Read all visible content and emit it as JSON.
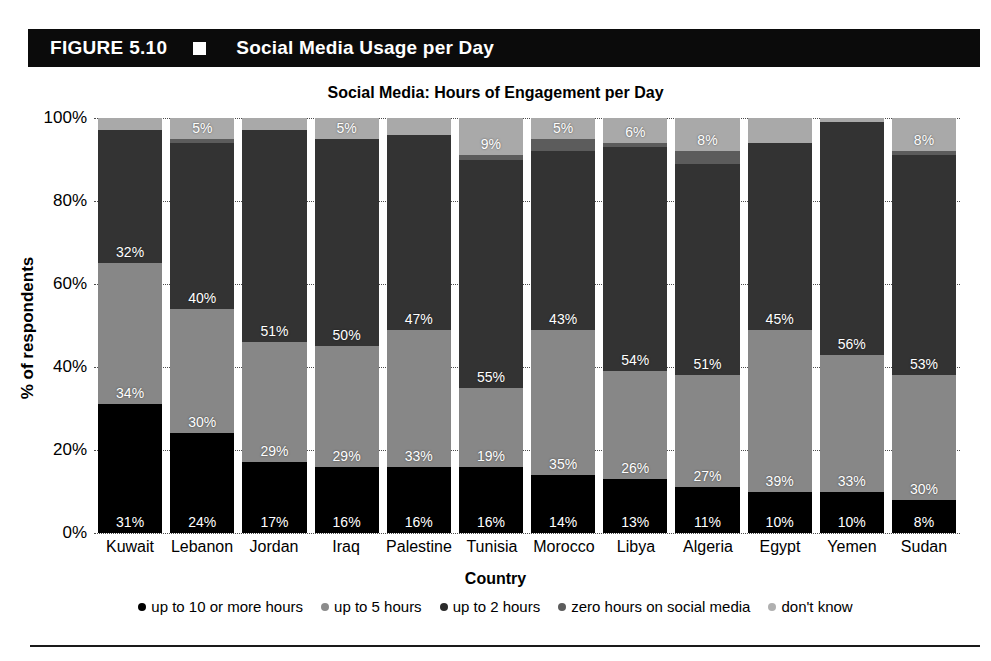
{
  "figure": {
    "number": "FIGURE 5.10",
    "marker_icon": "white-square-icon",
    "title": "Social Media Usage per Day"
  },
  "chart_data": {
    "type": "bar",
    "subtype": "stacked-bar-100-percent",
    "title": "Social Media: Hours of Engagement per Day",
    "xlabel": "Country",
    "ylabel": "% of respondents",
    "ylim": [
      0,
      100
    ],
    "yticks": [
      "0%",
      "20%",
      "40%",
      "60%",
      "80%",
      "100%"
    ],
    "grid": true,
    "legend_position": "bottom",
    "categories": [
      "Kuwait",
      "Lebanon",
      "Jordan",
      "Iraq",
      "Palestine",
      "Tunisia",
      "Morocco",
      "Libya",
      "Algeria",
      "Egypt",
      "Yemen",
      "Sudan"
    ],
    "series": [
      {
        "name": "up to 10 or more hours",
        "color": "#000000",
        "values": [
          31,
          24,
          17,
          16,
          16,
          16,
          14,
          13,
          11,
          10,
          10,
          8
        ],
        "labels": [
          "31%",
          "24%",
          "17%",
          "16%",
          "16%",
          "16%",
          "14%",
          "13%",
          "11%",
          "10%",
          "10%",
          "8%"
        ]
      },
      {
        "name": "up to 5 hours",
        "color": "#878787",
        "values": [
          34,
          30,
          29,
          29,
          33,
          19,
          35,
          26,
          27,
          39,
          33,
          30
        ],
        "labels": [
          "34%",
          "30%",
          "29%",
          "29%",
          "33%",
          "19%",
          "35%",
          "26%",
          "27%",
          "39%",
          "33%",
          "30%"
        ]
      },
      {
        "name": "up to 2 hours",
        "color": "#333333",
        "values": [
          32,
          40,
          51,
          50,
          47,
          55,
          43,
          54,
          51,
          45,
          56,
          53
        ],
        "labels": [
          "32%",
          "40%",
          "51%",
          "50%",
          "47%",
          "55%",
          "43%",
          "54%",
          "51%",
          "45%",
          "56%",
          "53%"
        ]
      },
      {
        "name": "zero hours on social media",
        "color": "#5c5c5c",
        "values": [
          0,
          1,
          0,
          0,
          0,
          1,
          3,
          1,
          3,
          0,
          0,
          1
        ],
        "labels": [
          "",
          "",
          "",
          "",
          "",
          "",
          "",
          "",
          "",
          "",
          "",
          ""
        ]
      },
      {
        "name": "don't know",
        "color": "#a9a9a9",
        "values": [
          3,
          5,
          3,
          5,
          4,
          9,
          5,
          6,
          8,
          6,
          1,
          8
        ],
        "labels": [
          "",
          "5%",
          "",
          "5%",
          "",
          "9%",
          "5%",
          "6%",
          "8%",
          "",
          "",
          "8%"
        ]
      }
    ]
  },
  "legend": {
    "items": [
      {
        "label": "up to 10 or more hours",
        "color": "#000000"
      },
      {
        "label": "up to 5 hours",
        "color": "#8c8c8c"
      },
      {
        "label": "up to 2 hours",
        "color": "#2b2b2b"
      },
      {
        "label": "zero hours on social media",
        "color": "#5c5c5c"
      },
      {
        "label": "don't know",
        "color": "#b0b0b0"
      }
    ]
  }
}
